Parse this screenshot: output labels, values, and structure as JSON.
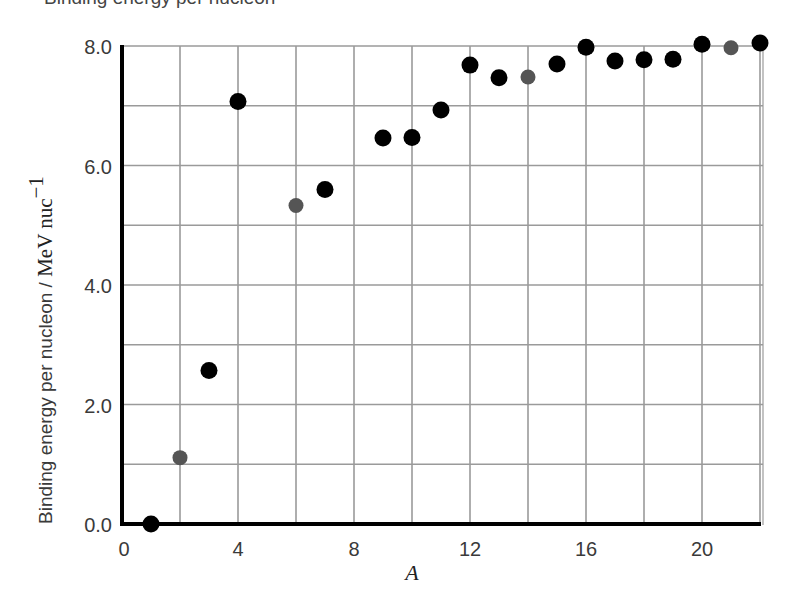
{
  "page": {
    "clipped_top_text": "Binding energy per nucleon"
  },
  "chart_data": {
    "type": "scatter",
    "title": "",
    "xlabel": "A",
    "ylabel": "Binding energy per nucleon / MeV nuc⁻¹",
    "ylabel_parts": {
      "main": "Binding energy per nucleon / ",
      "unit": "MeV nuc",
      "sup": "−1"
    },
    "xlim": [
      0,
      22
    ],
    "ylim": [
      0,
      8
    ],
    "xticks": [
      0,
      4,
      8,
      12,
      16,
      20
    ],
    "xtick_labels": [
      "0",
      "4",
      "8",
      "12",
      "16",
      "20"
    ],
    "yticks": [
      0,
      2,
      4,
      6,
      8
    ],
    "ytick_labels": [
      "0.0",
      "2.0",
      "4.0",
      "6.0",
      "8.0"
    ],
    "grid": {
      "x_step": 2,
      "y_step": 1,
      "visible": true
    },
    "legend": null,
    "colors": {
      "primary": "#000000",
      "secondary": "#555555",
      "grid": "#9a9a9a",
      "axis": "#000000"
    },
    "series": [
      {
        "name": "black points",
        "color": "#000000",
        "points": [
          {
            "x": 1,
            "y": 0.0
          },
          {
            "x": 3,
            "y": 2.57
          },
          {
            "x": 4,
            "y": 7.07
          },
          {
            "x": 7,
            "y": 5.6
          },
          {
            "x": 9,
            "y": 6.46
          },
          {
            "x": 10,
            "y": 6.47
          },
          {
            "x": 11,
            "y": 6.93
          },
          {
            "x": 12,
            "y": 7.68
          },
          {
            "x": 13,
            "y": 7.47
          },
          {
            "x": 15,
            "y": 7.7
          },
          {
            "x": 16,
            "y": 7.98
          },
          {
            "x": 17,
            "y": 7.75
          },
          {
            "x": 18,
            "y": 7.77
          },
          {
            "x": 19,
            "y": 7.78
          },
          {
            "x": 20,
            "y": 8.03
          },
          {
            "x": 22,
            "y": 8.05
          }
        ]
      },
      {
        "name": "gray points",
        "color": "#555555",
        "points": [
          {
            "x": 2,
            "y": 1.11
          },
          {
            "x": 6,
            "y": 5.33
          },
          {
            "x": 14,
            "y": 7.48
          },
          {
            "x": 21,
            "y": 7.97
          }
        ]
      }
    ]
  }
}
